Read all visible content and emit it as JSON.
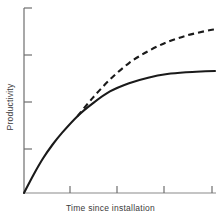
{
  "chart_data": {
    "type": "line",
    "title": "",
    "xlabel": "Time since installation",
    "ylabel": "Productivity",
    "xlim": [
      0,
      1
    ],
    "ylim": [
      0,
      1
    ],
    "grid": false,
    "legend": "none",
    "axis_tick_labels": {
      "x": [
        "",
        "",
        "",
        ""
      ],
      "y": [
        "",
        "",
        "",
        ""
      ]
    },
    "x_tick_positions": [
      0.24,
      0.48,
      0.73,
      1.0
    ],
    "y_tick_positions": [
      0.24,
      0.5,
      0.74,
      1.0
    ],
    "annotations": [
      "Two curves share a common path until a branch point, then the dashed curve continues rising while the solid curve plateaus."
    ],
    "series": [
      {
        "name": "Productivity with plateau",
        "style": "solid",
        "color": "#1a1a1a",
        "x": [
          0.0,
          0.05,
          0.1,
          0.15,
          0.2,
          0.28,
          0.36,
          0.45,
          0.55,
          0.65,
          0.75,
          0.85,
          0.95,
          1.0
        ],
        "y": [
          0.0,
          0.1,
          0.19,
          0.265,
          0.33,
          0.42,
          0.49,
          0.555,
          0.6,
          0.63,
          0.65,
          0.66,
          0.665,
          0.667
        ]
      },
      {
        "name": "Productivity continuing to rise",
        "style": "dashed",
        "color": "#1a1a1a",
        "dash_pattern": [
          6,
          4
        ],
        "x": [
          0.28,
          0.36,
          0.45,
          0.55,
          0.65,
          0.75,
          0.85,
          0.95,
          1.0
        ],
        "y": [
          0.42,
          0.52,
          0.62,
          0.71,
          0.775,
          0.825,
          0.86,
          0.885,
          0.895
        ]
      }
    ],
    "branch_point": {
      "x": 0.28,
      "y": 0.42
    }
  },
  "axes": {
    "y_axis_name": "y-axis",
    "x_axis_name": "x-axis"
  }
}
